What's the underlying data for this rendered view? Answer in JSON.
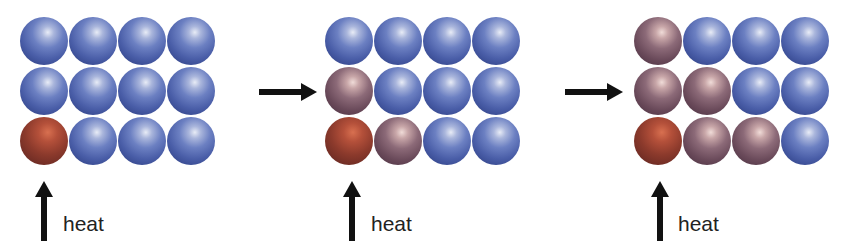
{
  "diagram": {
    "colors": {
      "cool": "#4a5ea8",
      "warm": "#8c6a78",
      "hot": "#8c3a2c",
      "arrow": "#111111",
      "text": "#222222"
    },
    "panels": [
      {
        "id": "stage-1",
        "heat_label": "heat",
        "rows": [
          [
            "cool",
            "cool",
            "cool",
            "cool"
          ],
          [
            "cool",
            "cool",
            "cool",
            "cool"
          ],
          [
            "hot",
            "cool",
            "cool",
            "cool"
          ]
        ]
      },
      {
        "id": "stage-2",
        "heat_label": "heat",
        "rows": [
          [
            "cool",
            "cool",
            "cool",
            "cool"
          ],
          [
            "warm",
            "cool",
            "cool",
            "cool"
          ],
          [
            "hot",
            "warm",
            "cool",
            "cool"
          ]
        ]
      },
      {
        "id": "stage-3",
        "heat_label": "heat",
        "rows": [
          [
            "warm",
            "cool",
            "cool",
            "cool"
          ],
          [
            "warm",
            "warm",
            "cool",
            "cool"
          ],
          [
            "hot",
            "warm",
            "warm",
            "cool"
          ]
        ]
      }
    ],
    "transition_arrows": [
      {
        "from": "stage-1",
        "to": "stage-2",
        "icon": "right-arrow-icon"
      },
      {
        "from": "stage-2",
        "to": "stage-3",
        "icon": "right-arrow-icon"
      }
    ],
    "heat_arrow_icon": "up-arrow-icon"
  }
}
